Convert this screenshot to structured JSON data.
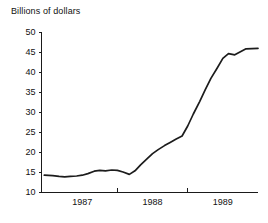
{
  "chart_data": {
    "type": "line",
    "title": "Billions of dollars",
    "xlabel": "",
    "ylabel": "Billions of dollars",
    "ylim": [
      10,
      50
    ],
    "ytick_labels": [
      "50",
      "45",
      "40",
      "35",
      "30",
      "25",
      "20",
      "15",
      "10"
    ],
    "ytick_values": [
      50,
      45,
      40,
      35,
      30,
      25,
      20,
      15,
      10
    ],
    "xtick_labels": [
      "1987",
      "1988",
      "1989"
    ],
    "xtick_values": [
      1987.5,
      1988.5,
      1989.5
    ],
    "x_boundary_ticks": [
      1988.0,
      1989.0
    ],
    "xlim": [
      1986.92,
      1990.0
    ],
    "grid": false,
    "legend": false,
    "series": [
      {
        "name": "Billions of dollars",
        "x": [
          1986.96,
          1987.08,
          1987.17,
          1987.25,
          1987.33,
          1987.42,
          1987.5,
          1987.58,
          1987.67,
          1987.75,
          1987.83,
          1987.92,
          1988.0,
          1988.08,
          1988.17,
          1988.25,
          1988.33,
          1988.42,
          1988.5,
          1988.58,
          1988.67,
          1988.75,
          1988.83,
          1988.92,
          1989.0,
          1989.08,
          1989.17,
          1989.25,
          1989.33,
          1989.42,
          1989.5,
          1989.58,
          1989.67,
          1989.83,
          1990.0
        ],
        "y": [
          14.2,
          14.1,
          13.9,
          13.8,
          13.9,
          14.0,
          14.2,
          14.6,
          15.2,
          15.4,
          15.3,
          15.5,
          15.4,
          15.0,
          14.4,
          15.3,
          16.8,
          18.3,
          19.6,
          20.6,
          21.6,
          22.4,
          23.2,
          24.0,
          26.5,
          29.5,
          32.6,
          35.6,
          38.4,
          41.0,
          43.4,
          44.6,
          44.3,
          45.8,
          45.9
        ]
      }
    ]
  }
}
